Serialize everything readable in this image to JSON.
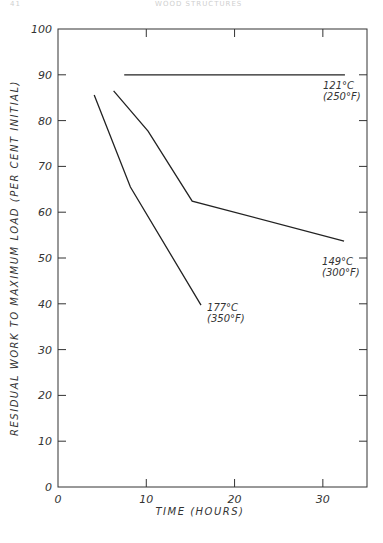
{
  "page": {
    "page_number": "41",
    "running_header": "WOOD STRUCTURES"
  },
  "chart_data": {
    "type": "line",
    "title": "",
    "xlabel": "TIME (HOURS)",
    "ylabel": "RESIDUAL WORK TO MAXIMUM LOAD (PER CENT INITIAL)",
    "xlim": [
      0,
      35
    ],
    "ylim": [
      0,
      100
    ],
    "x_ticks": [
      0,
      10,
      20,
      30
    ],
    "x_tick_labels": [
      "0",
      "10",
      "20",
      "30"
    ],
    "y_ticks": [
      0,
      10,
      20,
      30,
      40,
      50,
      60,
      70,
      80,
      90,
      100
    ],
    "y_tick_labels": [
      "0",
      "10",
      "20",
      "30",
      "40",
      "50",
      "60",
      "70",
      "80",
      "90",
      "100"
    ],
    "grid": false,
    "legend": "inline labels at line ends",
    "series": [
      {
        "name": "121°C (250°F)",
        "label_line1": "121°C",
        "label_line2": "(250°F)",
        "points": [
          [
            7.5,
            90
          ],
          [
            32.5,
            90
          ]
        ]
      },
      {
        "name": "149°C (300°F)",
        "label_line1": "149°C",
        "label_line2": "(300°F)",
        "points": [
          [
            6.3,
            86.5
          ],
          [
            10.2,
            77.7
          ],
          [
            15.2,
            62.4
          ],
          [
            32.4,
            53.7
          ]
        ]
      },
      {
        "name": "177°C (350°F)",
        "label_line1": "177°C",
        "label_line2": "(350°F)",
        "points": [
          [
            4.1,
            85.6
          ],
          [
            8.2,
            65.5
          ],
          [
            16.2,
            39.7
          ]
        ]
      }
    ],
    "line_color": "#222222"
  }
}
